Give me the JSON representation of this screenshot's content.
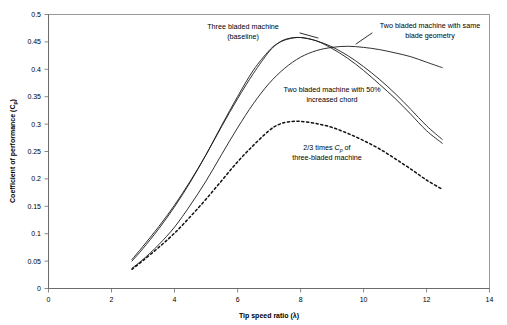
{
  "chart_data": {
    "type": "line",
    "title": "",
    "xlabel": "Tip speed ratio (λ)",
    "ylabel": "Coefficient of performance (C",
    "ylabel_sub": "p",
    "ylabel_tail": ")",
    "xlim": [
      0,
      14
    ],
    "ylim": [
      0,
      0.5
    ],
    "grid": false,
    "legend_position": "inline-annotations",
    "xticks": [
      "0",
      "2",
      "4",
      "6",
      "8",
      "10",
      "12",
      "14"
    ],
    "xtick_values": [
      0,
      2,
      4,
      6,
      8,
      10,
      12,
      14
    ],
    "yticks": [
      "0",
      "0.05",
      "0.1",
      "0.15",
      "0.2",
      "0.25",
      "0.3",
      "0.35",
      "0.4",
      "0.45",
      "0.5"
    ],
    "ytick_values": [
      0,
      0.05,
      0.1,
      0.15,
      0.2,
      0.25,
      0.3,
      0.35,
      0.4,
      0.45,
      0.5
    ],
    "series": [
      {
        "name": "Three bladed machine (baseline)",
        "style": "solid",
        "x": [
          2.65,
          3.0,
          3.5,
          4.0,
          4.5,
          5.0,
          5.5,
          6.0,
          6.5,
          7.0,
          7.3,
          7.6,
          8.0,
          8.5,
          9.0,
          9.5,
          10.0,
          10.5,
          11.0,
          11.5,
          12.0,
          12.5
        ],
        "y": [
          0.053,
          0.077,
          0.113,
          0.152,
          0.196,
          0.244,
          0.296,
          0.346,
          0.392,
          0.432,
          0.448,
          0.456,
          0.458,
          0.452,
          0.441,
          0.425,
          0.405,
          0.382,
          0.356,
          0.327,
          0.297,
          0.272
        ]
      },
      {
        "name": "Two bladed machine with same blade geometry",
        "style": "solid",
        "x": [
          2.65,
          3.0,
          3.5,
          4.0,
          4.5,
          5.0,
          5.5,
          6.0,
          6.5,
          7.0,
          7.3,
          7.6,
          8.0,
          8.5,
          9.0,
          9.5,
          10.0,
          10.5,
          11.0,
          11.5,
          12.0,
          12.5
        ],
        "y": [
          0.05,
          0.073,
          0.109,
          0.149,
          0.194,
          0.244,
          0.298,
          0.35,
          0.398,
          0.434,
          0.448,
          0.455,
          0.458,
          0.452,
          0.438,
          0.42,
          0.398,
          0.373,
          0.347,
          0.318,
          0.288,
          0.265
        ]
      },
      {
        "name": "Two bladed machine with 50% increased chord",
        "style": "solid",
        "x": [
          2.65,
          3.0,
          3.5,
          4.0,
          4.5,
          5.0,
          5.5,
          6.0,
          6.5,
          7.0,
          7.5,
          8.0,
          8.5,
          9.0,
          9.5,
          10.0,
          10.5,
          11.0,
          11.5,
          12.0,
          12.5
        ],
        "y": [
          0.037,
          0.053,
          0.08,
          0.112,
          0.152,
          0.196,
          0.245,
          0.293,
          0.337,
          0.374,
          0.402,
          0.422,
          0.434,
          0.44,
          0.442,
          0.44,
          0.436,
          0.43,
          0.423,
          0.413,
          0.403
        ]
      },
      {
        "name": "2/3 times Cp of three-bladed machine",
        "style": "dashed",
        "x": [
          2.65,
          3.0,
          3.5,
          4.0,
          4.5,
          5.0,
          5.5,
          6.0,
          6.5,
          7.0,
          7.3,
          7.6,
          8.0,
          8.5,
          9.0,
          9.5,
          10.0,
          10.5,
          11.0,
          11.5,
          12.0,
          12.5
        ],
        "y": [
          0.035,
          0.051,
          0.075,
          0.101,
          0.131,
          0.163,
          0.197,
          0.231,
          0.261,
          0.288,
          0.299,
          0.304,
          0.305,
          0.301,
          0.294,
          0.283,
          0.27,
          0.255,
          0.237,
          0.218,
          0.198,
          0.181
        ]
      }
    ],
    "annotations": [
      {
        "id": "annot-three-bladed",
        "line1": "Three bladed machine",
        "line2": "(baseline)"
      },
      {
        "id": "annot-two-bladed-same",
        "line1": "Two bladed machine with same",
        "line2": "blade geometry"
      },
      {
        "id": "annot-two-bladed-chord",
        "line1": "Two bladed machine with 50%",
        "line2": "increased chord"
      },
      {
        "id": "annot-two-thirds",
        "line1_pre": "2/3 times ",
        "line1_ital": "C",
        "line1_sub": "p",
        "line1_post": " of",
        "line2": "three-bladed machine"
      }
    ]
  }
}
